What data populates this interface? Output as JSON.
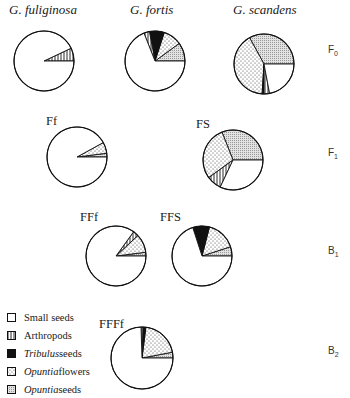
{
  "columns": [
    "G. fuliginosa",
    "G. fortis",
    "G. scandens"
  ],
  "rows": [
    {
      "label": "F",
      "sub": "0"
    },
    {
      "label": "F",
      "sub": "1"
    },
    {
      "label": "B",
      "sub": "1"
    },
    {
      "label": "B",
      "sub": "2"
    }
  ],
  "legend": [
    {
      "key": "small",
      "italic": "",
      "text": "Small seeds"
    },
    {
      "key": "arthropods",
      "italic": "",
      "text": "Arthropods"
    },
    {
      "key": "tribulus",
      "italic": "Tribulus",
      "text": " seeds"
    },
    {
      "key": "opuntia_flowers",
      "italic": "Opuntia",
      "text": " flowers"
    },
    {
      "key": "opuntia_seeds",
      "italic": "Opuntia",
      "text": " seeds"
    }
  ],
  "chart_data": {
    "type": "pie",
    "title": "",
    "categories": [
      "Small seeds",
      "Arthropods",
      "Tribulus seeds",
      "Opuntia flowers",
      "Opuntia seeds"
    ],
    "note": "Slices drawn counter-clockwise starting from 3 o'clock; values are approximate % of diet",
    "pies": [
      {
        "id": "fuliginosa_F0",
        "label": "G. fuliginosa",
        "row": "F0",
        "cx": 44,
        "cy": 61,
        "r": 30,
        "slices": [
          {
            "cat": "arthropods",
            "value": 7
          },
          {
            "cat": "small",
            "value": 93
          }
        ]
      },
      {
        "id": "fortis_F0",
        "label": "G. fortis",
        "row": "F0",
        "cx": 155,
        "cy": 61,
        "r": 30,
        "slices": [
          {
            "cat": "opuntia_seeds",
            "value": 10
          },
          {
            "cat": "opuntia_flowers",
            "value": 10
          },
          {
            "cat": "tribulus",
            "value": 8
          },
          {
            "cat": "arthropods",
            "value": 3
          },
          {
            "cat": "small",
            "value": 69
          }
        ]
      },
      {
        "id": "scandens_F0",
        "label": "G. scandens",
        "row": "F0",
        "cx": 264,
        "cy": 64,
        "r": 30,
        "slices": [
          {
            "cat": "opuntia_seeds",
            "value": 33
          },
          {
            "cat": "opuntia_flowers",
            "value": 41
          },
          {
            "cat": "tribulus",
            "value": 1
          },
          {
            "cat": "arthropods",
            "value": 3
          },
          {
            "cat": "small",
            "value": 22
          }
        ]
      },
      {
        "id": "Ff_F1",
        "label": "Ff",
        "row": "F1",
        "cx": 77,
        "cy": 157,
        "r": 30,
        "slices": [
          {
            "cat": "opuntia_seeds",
            "value": 2
          },
          {
            "cat": "opuntia_flowers",
            "value": 6
          },
          {
            "cat": "small",
            "value": 92
          }
        ]
      },
      {
        "id": "FS_F1",
        "label": "FS",
        "row": "F1",
        "cx": 233,
        "cy": 160,
        "r": 30,
        "slices": [
          {
            "cat": "opuntia_seeds",
            "value": 31
          },
          {
            "cat": "opuntia_flowers",
            "value": 29
          },
          {
            "cat": "arthropods",
            "value": 8
          },
          {
            "cat": "small",
            "value": 32
          }
        ]
      },
      {
        "id": "FFf_B1",
        "label": "FFf",
        "row": "B1",
        "cx": 116,
        "cy": 256,
        "r": 30,
        "slices": [
          {
            "cat": "opuntia_seeds",
            "value": 2
          },
          {
            "cat": "opuntia_flowers",
            "value": 10
          },
          {
            "cat": "arthropods",
            "value": 3
          },
          {
            "cat": "small",
            "value": 85
          }
        ]
      },
      {
        "id": "FFS_B1",
        "label": "FFS",
        "row": "B1",
        "cx": 202,
        "cy": 256,
        "r": 30,
        "slices": [
          {
            "cat": "opuntia_seeds",
            "value": 5
          },
          {
            "cat": "opuntia_flowers",
            "value": 16
          },
          {
            "cat": "tribulus",
            "value": 9
          },
          {
            "cat": "small",
            "value": 70
          }
        ]
      },
      {
        "id": "FFFf_B2",
        "label": "FFFf",
        "row": "B2",
        "cx": 142,
        "cy": 358,
        "r": 31,
        "slices": [
          {
            "cat": "opuntia_seeds",
            "value": 3
          },
          {
            "cat": "opuntia_flowers",
            "value": 20
          },
          {
            "cat": "tribulus",
            "value": 1.5
          },
          {
            "cat": "arthropods",
            "value": 1
          },
          {
            "cat": "small",
            "value": 74.5
          }
        ]
      }
    ],
    "legend_position": "bottom-left"
  }
}
